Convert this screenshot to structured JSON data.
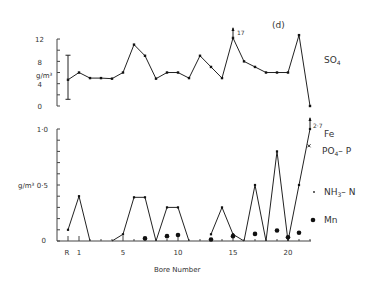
{
  "chart_data": [
    {
      "type": "line",
      "panel_label": "(d)",
      "title": "SO4",
      "ylabel": "g/m³",
      "ylim": [
        0,
        12
      ],
      "yticks": [
        0,
        4,
        8,
        12
      ],
      "x": [
        "R",
        1,
        2,
        3,
        4,
        5,
        6,
        7,
        8,
        9,
        10,
        11,
        12,
        13,
        14,
        15,
        16,
        17,
        18,
        19,
        20,
        21,
        22
      ],
      "series": [
        {
          "name": "SO4",
          "values": [
            4.7,
            6.0,
            5.0,
            5.0,
            4.9,
            6.0,
            11.0,
            9.0,
            4.9,
            6.0,
            6.0,
            5.0,
            9.0,
            7.0,
            5.0,
            12.2,
            8.0,
            7.0,
            6.0,
            6.0,
            6.0,
            12.7,
            0
          ]
        }
      ],
      "error_bar": {
        "x": "R",
        "low": 1.2,
        "high": 9.1
      },
      "annotations": [
        {
          "x": 15,
          "text": "17",
          "arrow": "up"
        }
      ]
    },
    {
      "type": "line",
      "ylabel": "g/m³",
      "xlabel": "Bore Number",
      "ylim": [
        0,
        1.0
      ],
      "yticks": [
        0,
        0.5,
        1.0
      ],
      "ytick_labels": [
        "0",
        "0·5",
        "1·0"
      ],
      "xtick_labels": [
        "R",
        "1",
        "5",
        "10",
        "15",
        "20"
      ],
      "legend": [
        "Fe",
        "PO4–P",
        "NH3–N",
        "Mn"
      ],
      "series": [
        {
          "name": "Fe",
          "x": [
            "R",
            1,
            2,
            4,
            5,
            6,
            7,
            8,
            9,
            10,
            11,
            13,
            14,
            15,
            16,
            17,
            18,
            19,
            20,
            21,
            22
          ],
          "values": [
            0.1,
            0.4,
            0,
            0,
            0.06,
            0.39,
            0.39,
            0,
            0.3,
            0.3,
            0,
            0.06,
            0.3,
            0.06,
            0,
            0.5,
            0,
            0.8,
            0,
            0.5,
            1.0
          ]
        },
        {
          "name": "PO4–P",
          "x": [
            22
          ],
          "values": [
            0.85
          ]
        },
        {
          "name": "Mn",
          "x": [
            7,
            9,
            10,
            13,
            15,
            17,
            19,
            20,
            21
          ],
          "values": [
            0.01,
            0.03,
            0.04,
            0.0,
            0.03,
            0.05,
            0.08,
            0.02,
            0.06
          ]
        }
      ],
      "annotations": [
        {
          "x": 22,
          "text": "2·7",
          "arrow": "up",
          "series": "Fe"
        }
      ]
    }
  ],
  "labels": {
    "panel": "(d)",
    "so4": "SO",
    "so4_sub": "4",
    "unit": "g/m³",
    "xlabel": "Bore Number",
    "arrow17": "17",
    "arrow27": "2·7",
    "legend_fe": "Fe",
    "legend_po4": "PO",
    "legend_po4_sub": "4",
    "legend_po4_tail": "– P",
    "legend_nh3": "NH",
    "legend_nh3_sub": "3",
    "legend_nh3_tail": "– N",
    "legend_mn": "Mn"
  }
}
